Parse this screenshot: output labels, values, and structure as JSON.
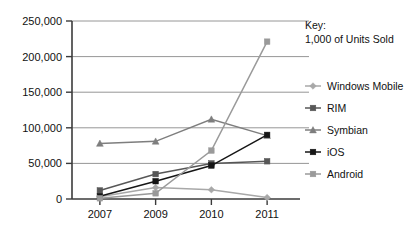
{
  "chart_data": {
    "type": "line",
    "title": "",
    "subtitle": "",
    "xlabel": "",
    "ylabel": "",
    "categories": [
      "2007",
      "2009",
      "2010",
      "2011"
    ],
    "ylim": [
      0,
      250000
    ],
    "yticks": [
      0,
      50000,
      100000,
      150000,
      200000,
      250000
    ],
    "ytick_labels": [
      "0",
      "50,000",
      "100,000",
      "150,000",
      "200,000",
      "250,000"
    ],
    "grid": true,
    "legend_position": "right",
    "series": [
      {
        "name": "Windows Mobile",
        "values": [
          3000,
          16000,
          13000,
          2000
        ],
        "color": "#a8a8a8",
        "marker": "diamond"
      },
      {
        "name": "RIM",
        "values": [
          12000,
          35000,
          50000,
          53000
        ],
        "color": "#575757",
        "marker": "square"
      },
      {
        "name": "Symbian",
        "values": [
          78000,
          81000,
          112000,
          89000
        ],
        "color": "#7e7e7e",
        "marker": "triangle"
      },
      {
        "name": "iOS",
        "values": [
          4000,
          25000,
          47000,
          90000
        ],
        "color": "#161616",
        "marker": "square"
      },
      {
        "name": "Android",
        "values": [
          1000,
          8000,
          68000,
          221000
        ],
        "color": "#9a9a9a",
        "marker": "square"
      }
    ]
  },
  "key": {
    "title": "Key:",
    "units": "1,000 of Units Sold"
  },
  "legend": {
    "items": [
      {
        "label": "Windows Mobile"
      },
      {
        "label": "RIM"
      },
      {
        "label": "Symbian"
      },
      {
        "label": "iOS"
      },
      {
        "label": "Android"
      }
    ]
  }
}
